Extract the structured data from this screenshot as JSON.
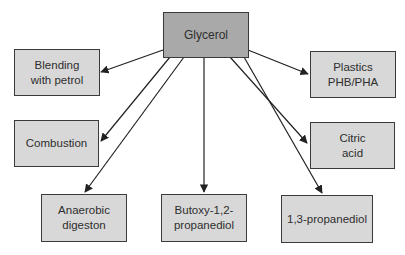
{
  "diagram": {
    "type": "flow",
    "colors": {
      "root_fill": "#a9a9a9",
      "node_fill": "#d8d8d8",
      "border": "#3a3a3a",
      "arrow": "#222222",
      "text": "#2e2e2e"
    },
    "root": {
      "id": "glycerol",
      "label": "Glycerol"
    },
    "nodes": [
      {
        "id": "blending",
        "label": "Blending\nwith petrol"
      },
      {
        "id": "combustion",
        "label": "Combustion"
      },
      {
        "id": "anaerobic",
        "label": "Anaerobic\ndigeston"
      },
      {
        "id": "butoxy",
        "label": "Butoxy-1,2-\npropanediol"
      },
      {
        "id": "propanediol",
        "label": "1,3-propanediol"
      },
      {
        "id": "citric",
        "label": "Citric\nacid"
      },
      {
        "id": "plastics",
        "label": "Plastics\nPHB/PHA"
      }
    ],
    "edges": [
      {
        "from": "glycerol",
        "to": "blending"
      },
      {
        "from": "glycerol",
        "to": "combustion"
      },
      {
        "from": "glycerol",
        "to": "anaerobic"
      },
      {
        "from": "glycerol",
        "to": "butoxy"
      },
      {
        "from": "glycerol",
        "to": "propanediol"
      },
      {
        "from": "glycerol",
        "to": "citric"
      },
      {
        "from": "glycerol",
        "to": "plastics"
      }
    ]
  }
}
